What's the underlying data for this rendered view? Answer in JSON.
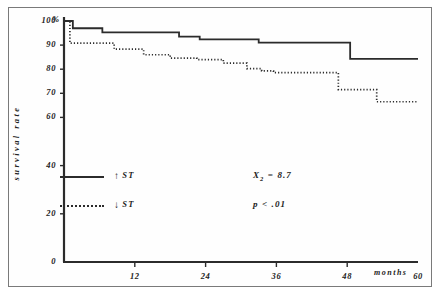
{
  "figure": {
    "frame_color": "#7a7a7a",
    "background": "#ffffff",
    "ink_color": "#2b2b2b"
  },
  "axes": {
    "y_title": "survival rate",
    "y_percent_symbol": "%",
    "x_title": "months",
    "y_ticks": [
      {
        "value": 100,
        "label": "100"
      },
      {
        "value": 90,
        "label": "90"
      },
      {
        "value": 80,
        "label": "80"
      },
      {
        "value": 70,
        "label": "70"
      },
      {
        "value": 60,
        "label": "60"
      },
      {
        "value": 40,
        "label": "40"
      },
      {
        "value": 20,
        "label": "20"
      },
      {
        "value": 0,
        "label": "0"
      }
    ],
    "x_ticks": [
      {
        "value": 12,
        "label": "12"
      },
      {
        "value": 24,
        "label": "24"
      },
      {
        "value": 36,
        "label": "36"
      },
      {
        "value": 48,
        "label": "48"
      },
      {
        "value": 60,
        "label": "60"
      }
    ]
  },
  "legend": {
    "items": [
      {
        "arrow": "↑",
        "label": "ST",
        "style": "solid",
        "name": "legend-item-st-up"
      },
      {
        "arrow": "↓",
        "label": "ST",
        "style": "dotted",
        "name": "legend-item-st-down"
      }
    ]
  },
  "statistics": {
    "chi_square_symbol": "X",
    "chi_square_subscript": "2",
    "chi_square_equals": "= 8.7",
    "chi_square_full": "X2 = 8.7",
    "p_value": "p < .01"
  },
  "chart_data": {
    "type": "line",
    "title": "",
    "xlabel": "months",
    "ylabel": "survival rate",
    "xlim": [
      0,
      60
    ],
    "ylim": [
      0,
      100
    ],
    "grid": false,
    "legend_position": "inside-lower-left",
    "step_style": "post",
    "series": [
      {
        "name": "↑ ST",
        "style": "solid",
        "color": "#2b2b2b",
        "x": [
          0,
          1.5,
          6.5,
          19.5,
          23.0,
          30.5,
          33.0,
          44.5,
          48.5,
          60
        ],
        "y": [
          100,
          97.0,
          95.3,
          93.5,
          92.4,
          92.4,
          91.0,
          91.0,
          84.3,
          84.3
        ]
      },
      {
        "name": "↓ ST",
        "style": "dotted",
        "color": "#2b2b2b",
        "x": [
          0,
          1.0,
          8.5,
          13.5,
          18.0,
          22.5,
          27.0,
          31.0,
          33.5,
          35.5,
          46.5,
          53.0,
          60
        ],
        "y": [
          100,
          90.8,
          88.3,
          86.0,
          84.6,
          84.0,
          82.5,
          80.2,
          79.3,
          78.6,
          71.5,
          66.5,
          66.5
        ]
      }
    ],
    "annotations": [
      {
        "text": "X2 = 8.7",
        "x": 28,
        "y": 36
      },
      {
        "text": "p < .01",
        "x": 28,
        "y": 22
      }
    ]
  }
}
